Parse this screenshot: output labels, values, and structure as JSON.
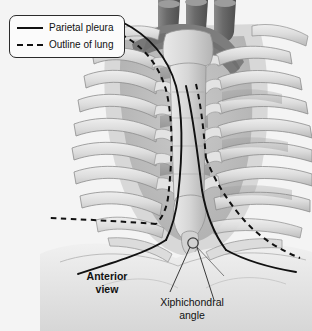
{
  "figure": {
    "background_color": "#f4f4f4",
    "line_color": "#111111",
    "bone_color": "#d8d8d8",
    "shadow_color": "#8e8e8e",
    "vessel_color": "#6f6f6f"
  },
  "legend": {
    "items": [
      {
        "label": "Parietal pleura",
        "style": "solid",
        "icon": "solid-line-swatch"
      },
      {
        "label": "Outline of lung",
        "style": "dashed",
        "icon": "dashed-line-swatch"
      }
    ]
  },
  "labels": {
    "anterior_view": "Anterior\nview",
    "anterior_view_line1": "Anterior",
    "anterior_view_line2": "view",
    "xiphichondral": "Xiphichondral\nangle",
    "xiphichondral_line1": "Xiphichondral",
    "xiphichondral_line2": "angle"
  },
  "anatomy": {
    "structures": [
      "great vessels",
      "clavicle",
      "manubrium of sternum",
      "body of sternum",
      "xiphoid process",
      "ribs",
      "costal cartilages",
      "intercostal spaces",
      "costal margin",
      "diaphragm"
    ],
    "rib_pairs_visible": 7,
    "vessel_stumps": 3
  }
}
